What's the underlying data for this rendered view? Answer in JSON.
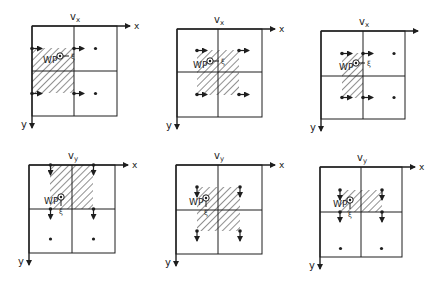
{
  "figure": {
    "ink_color": "#1e1e1e",
    "background": "#ffffff"
  },
  "panels": [
    {
      "id": "vx-1",
      "title": "vx",
      "x_axis_label": "x",
      "y_axis_label": "y",
      "point_label": "WP",
      "small_mark": "ξ",
      "frame": [
        32,
        26,
        117,
        116
      ],
      "mid": [
        74,
        71
      ],
      "hatch": [
        32,
        48,
        74,
        93
      ],
      "wp": [
        60,
        56
      ],
      "show_x_label": true
    },
    {
      "id": "vx-2",
      "title": "vx",
      "x_axis_label": "x",
      "y_axis_label": "y",
      "point_label": "WP",
      "small_mark": "ξ",
      "frame": [
        177,
        29,
        262,
        117
      ],
      "mid": [
        218,
        72
      ],
      "hatch": [
        197,
        50,
        239,
        95
      ],
      "wp": [
        210,
        61
      ],
      "show_x_label": true
    },
    {
      "id": "vx-3",
      "title": "vx",
      "x_axis_label": "x",
      "y_axis_label": "y",
      "point_label": "WP",
      "small_mark": "ξ",
      "frame": [
        321,
        31,
        405,
        119
      ],
      "mid": [
        363,
        76
      ],
      "hatch": [
        342,
        53,
        363,
        98
      ],
      "wp": [
        356,
        63
      ],
      "show_x_label": false
    },
    {
      "id": "vy-1",
      "title": "vy",
      "x_axis_label": "x",
      "y_axis_label": "y",
      "point_label": "WP",
      "small_mark": "ξ",
      "frame": [
        29,
        165,
        115,
        253
      ],
      "mid": [
        72,
        209
      ],
      "hatch": [
        50,
        165,
        93,
        209
      ],
      "wp": [
        61,
        197
      ],
      "show_x_label": true
    },
    {
      "id": "vy-2",
      "title": "vy",
      "x_axis_label": "x",
      "y_axis_label": "y",
      "point_label": "WP",
      "small_mark": "ξ",
      "frame": [
        176,
        165,
        262,
        254
      ],
      "mid": [
        218,
        210
      ],
      "hatch": [
        197,
        187,
        240,
        231
      ],
      "wp": [
        206,
        198
      ],
      "show_x_label": true
    },
    {
      "id": "vy-3",
      "title": "vy",
      "x_axis_label": "x",
      "y_axis_label": "y",
      "point_label": "WP",
      "small_mark": "ξ",
      "frame": [
        320,
        167,
        402,
        257
      ],
      "mid": [
        361,
        212
      ],
      "hatch": [
        340,
        190,
        382,
        212
      ],
      "wp": [
        350,
        200
      ],
      "show_x_label": true
    }
  ]
}
